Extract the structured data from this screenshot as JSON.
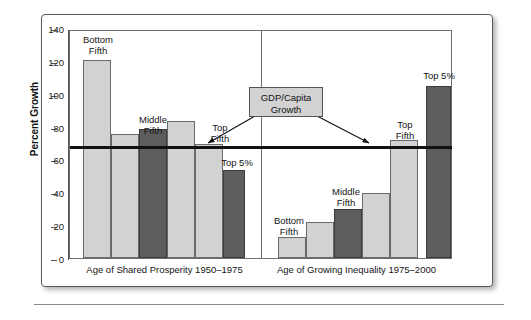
{
  "chart_data": {
    "type": "bar",
    "title": "",
    "xlabel": "",
    "ylabel": "Percent Growth",
    "ylim": [
      0,
      140
    ],
    "yticks": [
      0,
      20,
      40,
      60,
      80,
      100,
      120,
      140
    ],
    "grid": false,
    "legend": "none",
    "groups": [
      {
        "name": "Age of Shared Prosperity 1950–1975",
        "categories": [
          "Bottom Fifth",
          "Second Fifth",
          "Middle Fifth",
          "Fourth Fifth",
          "Top Fifth",
          "Top 5%"
        ],
        "values": [
          121,
          76,
          79,
          84,
          70,
          54
        ],
        "styles": [
          "light",
          "light",
          "dark",
          "light",
          "light",
          "dark"
        ]
      },
      {
        "name": "Age of Growing Inequality 1975–2000",
        "categories": [
          "Bottom Fifth",
          "Second Fifth",
          "Middle Fifth",
          "Fourth Fifth",
          "Top Fifth",
          "Top 5%"
        ],
        "values": [
          13,
          22,
          30,
          40,
          72,
          105
        ],
        "styles": [
          "light",
          "light",
          "dark",
          "light",
          "light",
          "dark"
        ]
      }
    ],
    "reference_line": {
      "label": "GDP/Capita Growth",
      "left_group_value": 70,
      "right_group_value": 70
    },
    "annotations": [
      "Bottom Fifth",
      "Middle Fifth",
      "Top Fifth",
      "Top 5%",
      "GDP/Capita Growth"
    ]
  },
  "axis": {
    "y_title": "Percent Growth",
    "y_ticks": [
      "140",
      "120",
      "100",
      "80",
      "60",
      "40",
      "20",
      "0"
    ]
  },
  "callout": {
    "line1": "GDP/Capita",
    "line2": "Growth"
  },
  "left_group": {
    "axis_label": "Age of Shared Prosperity 1950–1975",
    "labels": {
      "bottom_fifth_l1": "Bottom",
      "bottom_fifth_l2": "Fifth",
      "middle_fifth_l1": "Middle",
      "middle_fifth_l2": "Fifth",
      "top_fifth_l1": "Top",
      "top_fifth_l2": "Fifth",
      "top_five_pct": "Top 5%"
    }
  },
  "right_group": {
    "axis_label": "Age of Growing Inequality 1975–2000",
    "labels": {
      "bottom_fifth_l1": "Bottom",
      "bottom_fifth_l2": "Fifth",
      "middle_fifth_l1": "Middle",
      "middle_fifth_l2": "Fifth",
      "top_fifth_l1": "Top",
      "top_fifth_l2": "Fifth",
      "top_five_pct": "Top 5%"
    }
  },
  "colors": {
    "bar_light": "#d2d2d2",
    "bar_dark": "#5d5d5d",
    "line": "#111111",
    "frame": "#5a5a5a"
  }
}
